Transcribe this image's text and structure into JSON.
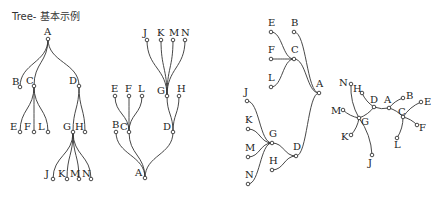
{
  "title": "Tree- 基本示例",
  "colors": {
    "stroke": "#333333",
    "text": "#222222",
    "background": "#ffffff"
  },
  "trees": [
    {
      "name": "top-down",
      "nodes": {
        "A": [
          48,
          39
        ],
        "B": [
          20,
          87
        ],
        "C": [
          34,
          86
        ],
        "D": [
          79,
          86
        ],
        "E": [
          20,
          132
        ],
        "F": [
          34,
          132
        ],
        "L": [
          48,
          132
        ],
        "G": [
          73,
          132
        ],
        "H": [
          85,
          132
        ],
        "J": [
          53,
          179
        ],
        "K": [
          67,
          179
        ],
        "M": [
          79,
          179
        ],
        "N": [
          91,
          179
        ]
      },
      "edges": [
        [
          "A",
          "B"
        ],
        [
          "A",
          "C"
        ],
        [
          "A",
          "D"
        ],
        [
          "C",
          "E"
        ],
        [
          "C",
          "F"
        ],
        [
          "C",
          "L"
        ],
        [
          "D",
          "G"
        ],
        [
          "D",
          "H"
        ],
        [
          "G",
          "J"
        ],
        [
          "G",
          "K"
        ],
        [
          "G",
          "M"
        ],
        [
          "G",
          "N"
        ]
      ],
      "orient": "v",
      "labels": {
        "A": [
          -4,
          -4
        ],
        "B": [
          -8,
          -2
        ],
        "C": [
          -8,
          -2
        ],
        "D": [
          -10,
          -2
        ],
        "E": [
          -10,
          -2
        ],
        "F": [
          -10,
          -2
        ],
        "L": [
          -10,
          -2
        ],
        "G": [
          -10,
          -2
        ],
        "H": [
          -10,
          -2
        ],
        "J": [
          -8,
          -2
        ],
        "K": [
          -9,
          -2
        ],
        "M": [
          -9,
          -2
        ],
        "N": [
          -9,
          -2
        ]
      }
    },
    {
      "name": "bottom-up",
      "nodes": {
        "J": [
          147,
          40
        ],
        "K": [
          161,
          40
        ],
        "M": [
          173,
          40
        ],
        "N": [
          185,
          40
        ],
        "E": [
          115,
          96
        ],
        "F": [
          129,
          96
        ],
        "L": [
          142,
          96
        ],
        "G": [
          167,
          96
        ],
        "H": [
          179,
          96
        ],
        "B": [
          116,
          132
        ],
        "C": [
          129,
          132
        ],
        "D": [
          173,
          132
        ],
        "A": [
          145,
          178
        ]
      },
      "edges": [
        [
          "A",
          "B"
        ],
        [
          "A",
          "C"
        ],
        [
          "A",
          "D"
        ],
        [
          "C",
          "E"
        ],
        [
          "C",
          "F"
        ],
        [
          "C",
          "L"
        ],
        [
          "D",
          "G"
        ],
        [
          "D",
          "H"
        ],
        [
          "G",
          "J"
        ],
        [
          "G",
          "K"
        ],
        [
          "G",
          "M"
        ],
        [
          "G",
          "N"
        ]
      ],
      "orient": "v",
      "labels": {
        "J": [
          -4,
          -4
        ],
        "K": [
          -4,
          -4
        ],
        "M": [
          -4,
          -4
        ],
        "N": [
          -4,
          -4
        ],
        "E": [
          -4,
          -4
        ],
        "F": [
          -4,
          -4
        ],
        "L": [
          -4,
          -4
        ],
        "G": [
          -10,
          -2
        ],
        "H": [
          -2,
          -4
        ],
        "B": [
          -4,
          -4
        ],
        "C": [
          -9,
          -2
        ],
        "D": [
          -10,
          -2
        ],
        "A": [
          -10,
          -2
        ]
      }
    },
    {
      "name": "right-to-left",
      "nodes": {
        "E": [
          271,
          32
        ],
        "B": [
          294,
          32
        ],
        "F": [
          271,
          59
        ],
        "C": [
          294,
          59
        ],
        "L": [
          271,
          87
        ],
        "A": [
          319,
          93
        ],
        "J": [
          247,
          101
        ],
        "K": [
          248,
          129
        ],
        "G": [
          272,
          143
        ],
        "M": [
          248,
          157
        ],
        "D": [
          296,
          156
        ],
        "H": [
          272,
          170
        ],
        "N": [
          248,
          184
        ]
      },
      "edges": [
        [
          "A",
          "B"
        ],
        [
          "A",
          "C"
        ],
        [
          "A",
          "D"
        ],
        [
          "C",
          "E"
        ],
        [
          "C",
          "F"
        ],
        [
          "C",
          "L"
        ],
        [
          "D",
          "G"
        ],
        [
          "D",
          "H"
        ],
        [
          "G",
          "J"
        ],
        [
          "G",
          "K"
        ],
        [
          "G",
          "M"
        ],
        [
          "G",
          "N"
        ]
      ],
      "orient": "h",
      "labels": {
        "E": [
          -3,
          -6
        ],
        "B": [
          -3,
          -6
        ],
        "F": [
          -3,
          -6
        ],
        "C": [
          -3,
          -6
        ],
        "L": [
          -3,
          -6
        ],
        "A": [
          -3,
          -6
        ],
        "J": [
          -3,
          -6
        ],
        "K": [
          -3,
          -6
        ],
        "G": [
          -3,
          -6
        ],
        "M": [
          -3,
          -6
        ],
        "D": [
          -3,
          -6
        ],
        "H": [
          -3,
          -6
        ],
        "N": [
          -3,
          -6
        ]
      }
    },
    {
      "name": "radial",
      "nodes": {
        "A": [
          389,
          108
        ],
        "B": [
          403,
          98
        ],
        "C": [
          403,
          117
        ],
        "E": [
          421,
          102
        ],
        "F": [
          417,
          125
        ],
        "L": [
          397,
          138
        ],
        "D": [
          374,
          107
        ],
        "H": [
          362,
          93
        ],
        "N": [
          351,
          84
        ],
        "G": [
          359,
          118
        ],
        "M": [
          343,
          110
        ],
        "K": [
          351,
          135
        ],
        "J": [
          372,
          155
        ]
      },
      "edges": [
        [
          "A",
          "B"
        ],
        [
          "A",
          "C"
        ],
        [
          "A",
          "D"
        ],
        [
          "C",
          "E"
        ],
        [
          "C",
          "F"
        ],
        [
          "C",
          "L"
        ],
        [
          "D",
          "G"
        ],
        [
          "D",
          "H"
        ],
        [
          "G",
          "J"
        ],
        [
          "G",
          "K"
        ],
        [
          "G",
          "M"
        ],
        [
          "G",
          "N"
        ]
      ],
      "orient": "r",
      "labels": {
        "A": [
          -5,
          -5
        ],
        "B": [
          3,
          1
        ],
        "C": [
          -5,
          -2
        ],
        "E": [
          3,
          3
        ],
        "F": [
          2,
          6
        ],
        "L": [
          -3,
          10
        ],
        "D": [
          -4,
          -4
        ],
        "H": [
          -9,
          -1
        ],
        "N": [
          -12,
          2
        ],
        "G": [
          2,
          7
        ],
        "M": [
          -12,
          4
        ],
        "K": [
          -10,
          5
        ],
        "J": [
          -4,
          11
        ]
      }
    }
  ]
}
